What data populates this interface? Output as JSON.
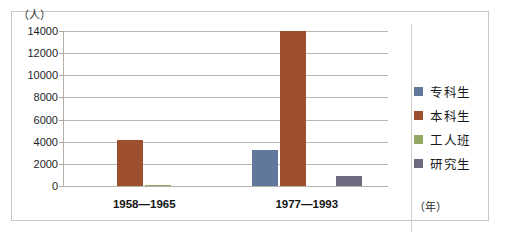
{
  "chart_data": {
    "type": "bar",
    "title": "",
    "subtitle": "",
    "xlabel": "（年）",
    "ylabel": "（人）",
    "categories": [
      "1958—1965",
      "1977—1993"
    ],
    "series": [
      {
        "name": "专科生",
        "color": "#61789c",
        "values": [
          0,
          3250
        ]
      },
      {
        "name": "本科生",
        "color": "#9d4f2e",
        "values": [
          4150,
          14000
        ]
      },
      {
        "name": "工人班",
        "color": "#93a862",
        "values": [
          120,
          0
        ]
      },
      {
        "name": "研究生",
        "color": "#6e6a80",
        "values": [
          0,
          900
        ]
      }
    ],
    "ylim": [
      0,
      14000
    ],
    "ytick_values": [
      0,
      2000,
      4000,
      6000,
      8000,
      10000,
      12000,
      14000
    ],
    "ytick_labels": [
      "0",
      "2000",
      "4000",
      "6000",
      "8000",
      "10000",
      "12000",
      "14000"
    ],
    "grid": true,
    "legend_position": "right",
    "legend_entries": [
      "专科生",
      "本科生",
      "工人班",
      "研究生"
    ]
  },
  "axes": {
    "y_unit_label": "（人）",
    "x_unit_label": "（年）"
  }
}
